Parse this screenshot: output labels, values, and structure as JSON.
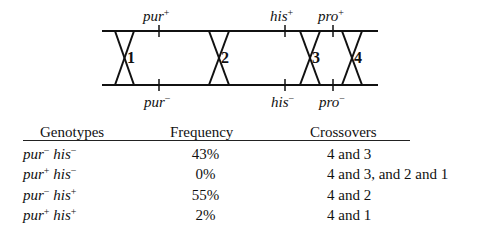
{
  "diagram": {
    "top_line_y": 31,
    "bottom_line_y": 85,
    "line_x_start": 102,
    "line_x_end": 378,
    "markers": [
      {
        "gene": "pur",
        "x": 159,
        "top_sign": "+",
        "bottom_sign": "−"
      },
      {
        "gene": "his",
        "x": 285,
        "top_sign": "+",
        "bottom_sign": "−"
      },
      {
        "gene": "pro",
        "x": 333,
        "top_sign": "+",
        "bottom_sign": "−"
      }
    ],
    "crossovers": [
      {
        "label": "1",
        "x1": 115,
        "x2": 134
      },
      {
        "label": "2",
        "x1": 209,
        "x2": 229
      },
      {
        "label": "3",
        "x1": 300,
        "x2": 320
      },
      {
        "label": "4",
        "x1": 342,
        "x2": 362
      }
    ]
  },
  "table": {
    "headers": {
      "genotypes": "Genotypes",
      "frequency": "Frequency",
      "crossovers": "Crossovers"
    },
    "rows": [
      {
        "pur": "pur",
        "pur_sign": "−",
        "his": "his",
        "his_sign": "−",
        "frequency": "43%",
        "crossovers": "4 and 3"
      },
      {
        "pur": "pur",
        "pur_sign": "+",
        "his": "his",
        "his_sign": "−",
        "frequency": "0%",
        "crossovers": "4 and 3, and 2 and 1"
      },
      {
        "pur": "pur",
        "pur_sign": "−",
        "his": "his",
        "his_sign": "+",
        "frequency": "55%",
        "crossovers": "4 and 2"
      },
      {
        "pur": "pur",
        "pur_sign": "+",
        "his": "his",
        "his_sign": "+",
        "frequency": "2%",
        "crossovers": "4 and 1"
      }
    ]
  }
}
